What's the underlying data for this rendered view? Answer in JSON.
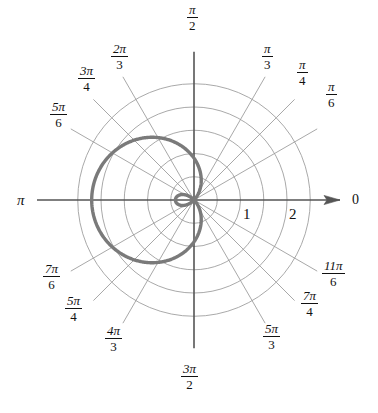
{
  "figure": {
    "background": "#ffffff",
    "grid_color": "#9a9a9a",
    "axis_color": "#555555",
    "curve_color": "#7a7a7a",
    "text_color": "#111111"
  },
  "angle_labels": [
    {
      "name": "angle-0",
      "num": "0",
      "den": "",
      "type": "plain",
      "x": 352,
      "y": 192
    },
    {
      "name": "angle-pi-6",
      "num": "π",
      "den": "6",
      "type": "frac",
      "x": 326,
      "y": 80
    },
    {
      "name": "angle-pi-4",
      "num": "π",
      "den": "4",
      "type": "frac",
      "x": 297,
      "y": 58
    },
    {
      "name": "angle-pi-3",
      "num": "π",
      "den": "3",
      "type": "frac",
      "x": 262,
      "y": 42
    },
    {
      "name": "angle-pi-2",
      "num": "π",
      "den": "2",
      "type": "frac",
      "x": 187,
      "y": 3
    },
    {
      "name": "angle-2pi-3",
      "num": "2π",
      "den": "3",
      "type": "frac",
      "x": 111,
      "y": 42
    },
    {
      "name": "angle-3pi-4",
      "num": "3π",
      "den": "4",
      "type": "frac",
      "x": 78,
      "y": 64
    },
    {
      "name": "angle-5pi-6",
      "num": "5π",
      "den": "6",
      "type": "frac",
      "x": 50,
      "y": 100
    },
    {
      "name": "angle-pi",
      "num": "π",
      "den": "",
      "type": "plain",
      "x": 17,
      "y": 192
    },
    {
      "name": "angle-7pi-6",
      "num": "7π",
      "den": "6",
      "type": "frac",
      "x": 43,
      "y": 262
    },
    {
      "name": "angle-5pi-4",
      "num": "5π",
      "den": "4",
      "type": "frac",
      "x": 65,
      "y": 294
    },
    {
      "name": "angle-4pi-3",
      "num": "4π",
      "den": "3",
      "type": "frac",
      "x": 105,
      "y": 324
    },
    {
      "name": "angle-3pi-2",
      "num": "3π",
      "den": "2",
      "type": "frac",
      "x": 181,
      "y": 362
    },
    {
      "name": "angle-5pi-3",
      "num": "5π",
      "den": "3",
      "type": "frac",
      "x": 263,
      "y": 322
    },
    {
      "name": "angle-7pi-4",
      "num": "7π",
      "den": "4",
      "type": "frac",
      "x": 301,
      "y": 289
    },
    {
      "name": "angle-11pi-6",
      "num": "11π",
      "den": "6",
      "type": "frac",
      "x": 322,
      "y": 259
    }
  ],
  "radial_labels": [
    {
      "name": "radial-tick-1",
      "text": "1",
      "x": 243,
      "y": 206
    },
    {
      "name": "radial-tick-2",
      "text": "2",
      "x": 289,
      "y": 206
    }
  ],
  "chart_data": {
    "type": "line",
    "coordinate_system": "polar",
    "title": "",
    "xlabel": "",
    "ylabel": "",
    "grid": true,
    "legend": false,
    "angle_tick_labels": [
      "0",
      "π/6",
      "π/4",
      "π/3",
      "π/2",
      "2π/3",
      "3π/4",
      "5π/6",
      "π",
      "7π/6",
      "5π/4",
      "4π/3",
      "3π/2",
      "5π/3",
      "7π/4",
      "11π/6"
    ],
    "radial_tick_labels": [
      "1",
      "2"
    ],
    "radial_tick_values": [
      1,
      2
    ],
    "radial_gridline_values": [
      0.5,
      1.0,
      1.5,
      2.0,
      2.5
    ],
    "rlim": [
      0,
      2.6
    ],
    "curve": {
      "name": "limacon-with-inner-loop",
      "equation": "r = 0.9 - 1.3*cos(theta)",
      "a": 0.9,
      "b": 1.3,
      "r_max": 2.2,
      "r_max_angle": "π",
      "inner_loop_extent": 0.4,
      "inner_loop_angle": "0",
      "color": "#7a7a7a",
      "line_width": 3.4
    },
    "series": [
      {
        "name": "limacon",
        "theta_deg": [
          0,
          10,
          20,
          30,
          40,
          50,
          60,
          70,
          80,
          90,
          100,
          110,
          120,
          130,
          140,
          150,
          160,
          170,
          180,
          190,
          200,
          210,
          220,
          230,
          240,
          250,
          260,
          270,
          280,
          290,
          300,
          310,
          320,
          330,
          340,
          350,
          360
        ],
        "r": [
          -0.4,
          -0.38,
          -0.32,
          -0.226,
          -0.096,
          0.064,
          0.25,
          0.455,
          0.674,
          0.9,
          1.126,
          1.345,
          1.55,
          1.736,
          1.896,
          2.026,
          2.122,
          2.18,
          2.2,
          2.18,
          2.122,
          2.026,
          1.896,
          1.736,
          1.55,
          1.345,
          1.126,
          0.9,
          0.674,
          0.455,
          0.25,
          0.064,
          -0.096,
          -0.226,
          -0.32,
          -0.38,
          -0.4
        ]
      }
    ]
  }
}
